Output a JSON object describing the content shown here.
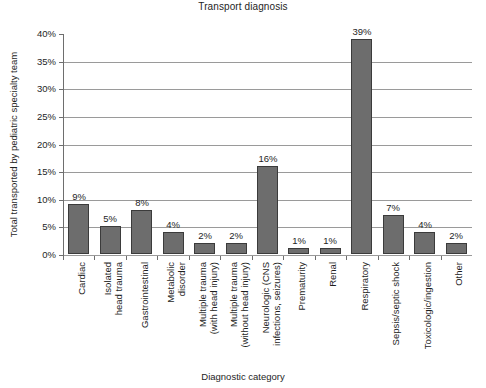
{
  "chart_data": {
    "type": "bar",
    "title": "Transport diagnosis",
    "xlabel": "Diagnostic category",
    "ylabel": "Total transported by pediatric specialty team",
    "ylim": [
      0,
      40
    ],
    "ytick_labels": [
      "0%",
      "5%",
      "10%",
      "15%",
      "20%",
      "25%",
      "30%",
      "35%",
      "40%"
    ],
    "ytick_values": [
      0,
      5,
      10,
      15,
      20,
      25,
      30,
      35,
      40
    ],
    "grid": "horizontal",
    "legend": "none",
    "bar_color": "#6d6d6d",
    "bar_edge_color": "#3b3b3b",
    "categories": [
      "Cardiac",
      "Isolated head trauma",
      "Gastrointestinal",
      "Metabolic disorder",
      "Multiple trauma (with head injury)",
      "Multiple trauma (without head injury)",
      "Neurologic (CNS infections, seizures)",
      "Prematurity",
      "Renal",
      "Respiratory",
      "Sepsis/septic shock",
      "Toxicologic/ingestion",
      "Other"
    ],
    "category_lines": [
      [
        "Cardiac"
      ],
      [
        "Isolated",
        "head trauma"
      ],
      [
        "Gastrointestinal"
      ],
      [
        "Metabolic",
        "disorder"
      ],
      [
        "Multiple trauma",
        "(with head injury)"
      ],
      [
        "Multiple trauma",
        "(without head injury)"
      ],
      [
        "Neurologic (CNS",
        "infections, seizures)"
      ],
      [
        "Prematurity"
      ],
      [
        "Renal"
      ],
      [
        "Respiratory"
      ],
      [
        "Sepsis/septic shock"
      ],
      [
        "Toxicologic/ingestion"
      ],
      [
        "Other"
      ]
    ],
    "values": [
      9,
      5,
      8,
      4,
      2,
      2,
      16,
      1,
      1,
      39,
      7,
      4,
      2
    ],
    "value_labels": [
      "9%",
      "5%",
      "8%",
      "4%",
      "2%",
      "2%",
      "16%",
      "1%",
      "1%",
      "39%",
      "7%",
      "4%",
      "2%"
    ]
  }
}
